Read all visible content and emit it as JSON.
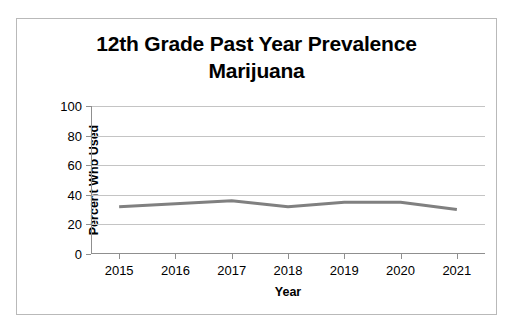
{
  "chart_data": {
    "type": "line",
    "title": "12th Grade Past Year Prevalence Marijuana",
    "title_line1": "12th Grade Past Year Prevalence",
    "title_line2": "Marijuana",
    "xlabel": "Year",
    "ylabel": "Percent Who Used",
    "categories": [
      "2015",
      "2016",
      "2017",
      "2018",
      "2019",
      "2020",
      "2021"
    ],
    "x": [
      2015,
      2016,
      2017,
      2018,
      2019,
      2020,
      2021
    ],
    "values": [
      32,
      34,
      36,
      32,
      35,
      35,
      30
    ],
    "series": [
      {
        "name": "Marijuana",
        "color": "#808080",
        "values": [
          32,
          34,
          36,
          32,
          35,
          35,
          30
        ]
      }
    ],
    "ylim": [
      0,
      100
    ],
    "yticks": [
      0,
      20,
      40,
      60,
      80,
      100
    ],
    "ytick_labels": [
      "0",
      "20",
      "40",
      "60",
      "80",
      "100"
    ],
    "xtick_labels": [
      "2015",
      "2016",
      "2017",
      "2018",
      "2019",
      "2020",
      "2021"
    ],
    "grid": true,
    "grid_axis": "y",
    "legend": false,
    "legend_position": "none",
    "markers": false,
    "line_width": 3,
    "colors": {
      "line": "#808080",
      "grid": "#c4c4c4",
      "axis": "#8f8f8f",
      "text": "#000000",
      "background": "#ffffff",
      "border": "#b9b9b9"
    }
  }
}
